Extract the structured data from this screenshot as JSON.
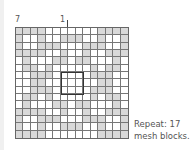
{
  "labels": {
    "left_marker": "7",
    "center_marker": "1"
  },
  "note": {
    "line1": "Repeat: 17",
    "line2": "mesh blocks."
  },
  "chart": {
    "rows": 15,
    "cols": 15,
    "filled_color": "#d9d9d9",
    "empty_color": "#ffffff",
    "line_color": "#777777",
    "center_box": {
      "row_start": 7,
      "col_start": 7,
      "size": 3
    },
    "pattern": [
      "111100000001111",
      "100100111001001",
      "100111000111001",
      "111100100100111",
      "010001101100010",
      "011010000010110",
      "001110000011100",
      "001100000001100",
      "001110000011100",
      "011010000010110",
      "010001101100010",
      "111100100100111",
      "100111000111001",
      "100100111001001",
      "111100000001111"
    ]
  }
}
